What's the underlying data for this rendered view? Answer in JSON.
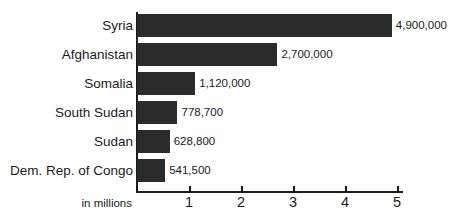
{
  "chart_data": {
    "type": "bar",
    "orientation": "horizontal",
    "title": "",
    "subtitle": "",
    "xlabel": "in millions",
    "ylabel": "",
    "categories": [
      "Syria",
      "Afghanistan",
      "Somalia",
      "South Sudan",
      "Sudan",
      "Dem. Rep. of Congo"
    ],
    "values": [
      4900000,
      2700000,
      1120000,
      778700,
      628800,
      541500
    ],
    "value_labels": [
      "4,900,000",
      "2,700,000",
      "1,120,000",
      "778,700",
      "628,800",
      "541,500"
    ],
    "xlim": [
      0,
      5
    ],
    "ylim": null,
    "xticks": [
      1,
      2,
      3,
      4,
      5
    ],
    "xtick_labels": [
      "1",
      "2",
      "3",
      "4",
      "5"
    ],
    "grid": false,
    "legend": null,
    "bar_color": "#2b2b2b",
    "axis_color": "#1a1a1a",
    "background_color": "#ffffff"
  },
  "axis": {
    "caption": "in millions",
    "ticks": [
      {
        "label": "1",
        "value": 1
      },
      {
        "label": "2",
        "value": 2
      },
      {
        "label": "3",
        "value": 3
      },
      {
        "label": "4",
        "value": 4
      },
      {
        "label": "5",
        "value": 5
      }
    ]
  },
  "bars": [
    {
      "label": "Syria",
      "value": 4900000,
      "value_label": "4,900,000"
    },
    {
      "label": "Afghanistan",
      "value": 2700000,
      "value_label": "2,700,000"
    },
    {
      "label": "Somalia",
      "value": 1120000,
      "value_label": "1,120,000"
    },
    {
      "label": "South Sudan",
      "value": 778700,
      "value_label": "778,700"
    },
    {
      "label": "Sudan",
      "value": 628800,
      "value_label": "628,800"
    },
    {
      "label": "Dem. Rep. of Congo",
      "value": 541500,
      "value_label": "541,500"
    }
  ]
}
